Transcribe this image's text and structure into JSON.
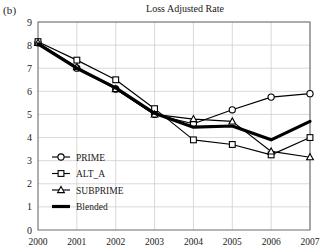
{
  "panel_label": "(b)",
  "chart_data": {
    "type": "line",
    "title": "Loss Adjusted Rate",
    "xlabel": "",
    "ylabel": "",
    "categories": [
      "2000",
      "2001",
      "2002",
      "2003",
      "2004",
      "2005",
      "2006",
      "2007"
    ],
    "x_tick_labels": [
      "2000",
      "2001",
      "2002",
      "2003",
      "2004",
      "2005",
      "2006",
      "2007"
    ],
    "y_tick_labels": [
      "0",
      "1",
      "2",
      "3",
      "4",
      "5",
      "6",
      "7",
      "8",
      "9"
    ],
    "ylim": [
      0,
      9
    ],
    "grid": "both",
    "legend_position": "inside-bottom-left",
    "series": [
      {
        "name": "PRIME",
        "marker": "circle",
        "values": [
          8.1,
          7.0,
          6.1,
          5.0,
          4.6,
          5.2,
          5.75,
          5.9
        ]
      },
      {
        "name": "ALT_A",
        "marker": "square",
        "values": [
          8.15,
          7.35,
          6.5,
          5.25,
          3.9,
          3.7,
          3.25,
          4.0
        ]
      },
      {
        "name": "SUBPRIME",
        "marker": "triangle",
        "values": [
          8.1,
          7.05,
          6.1,
          5.0,
          4.8,
          4.7,
          3.4,
          3.15
        ]
      },
      {
        "name": "Blended",
        "marker": "none",
        "values": [
          8.05,
          7.0,
          6.15,
          5.05,
          4.45,
          4.5,
          3.9,
          4.7
        ]
      }
    ]
  }
}
